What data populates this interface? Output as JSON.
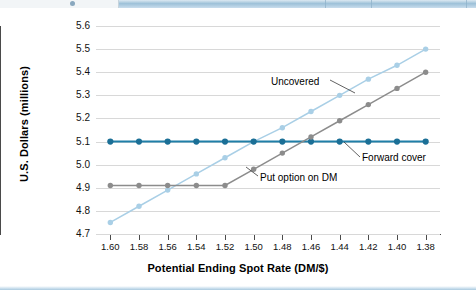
{
  "window": {
    "top_band": "window-title-band"
  },
  "chart_data": {
    "type": "line",
    "title": "",
    "xlabel": "Potential Ending Spot Rate (DM/$)",
    "ylabel": "U.S. Dollars (millions)",
    "categories": [
      "1.60",
      "1.58",
      "1.56",
      "1.54",
      "1.52",
      "1.50",
      "1.48",
      "1.46",
      "1.44",
      "1.42",
      "1.40",
      "1.38"
    ],
    "x_tick_labels": [
      "1.60",
      "1.58",
      "1.56",
      "1.54",
      "1.52",
      "1.50",
      "1.48",
      "1.46",
      "1.44",
      "1.42",
      "1.40",
      "1.38"
    ],
    "y_tick_labels": [
      "5.6",
      "5.5",
      "5.4",
      "5.3",
      "5.2",
      "5.1",
      "5.0",
      "4.9",
      "4.8",
      "4.7"
    ],
    "ylim": [
      4.7,
      5.6
    ],
    "ytick_step": 0.1,
    "grid": true,
    "legend": "inline-annotations",
    "series": [
      {
        "name": "Uncovered",
        "color": "#a9cfe6",
        "marker_color": "#a9cfe6",
        "values": [
          4.75,
          4.82,
          4.89,
          4.96,
          5.03,
          5.1,
          5.16,
          5.23,
          5.3,
          5.37,
          5.43,
          5.5
        ]
      },
      {
        "name": "Forward cover",
        "color": "#1f7fa8",
        "marker_color": "#1b6f96",
        "values": [
          5.1,
          5.1,
          5.1,
          5.1,
          5.1,
          5.1,
          5.1,
          5.1,
          5.1,
          5.1,
          5.1,
          5.1
        ]
      },
      {
        "name": "Put option on DM",
        "color": "#8c8c8c",
        "marker_color": "#8c8c8c",
        "values": [
          4.91,
          4.91,
          4.91,
          4.91,
          4.91,
          4.98,
          5.05,
          5.12,
          5.19,
          5.26,
          5.33,
          5.4
        ]
      }
    ],
    "annotations": [
      {
        "text": "Uncovered",
        "series": "Uncovered"
      },
      {
        "text": "Forward cover",
        "series": "Forward cover"
      },
      {
        "text": "Put option on DM",
        "series": "Put option on DM"
      }
    ]
  }
}
